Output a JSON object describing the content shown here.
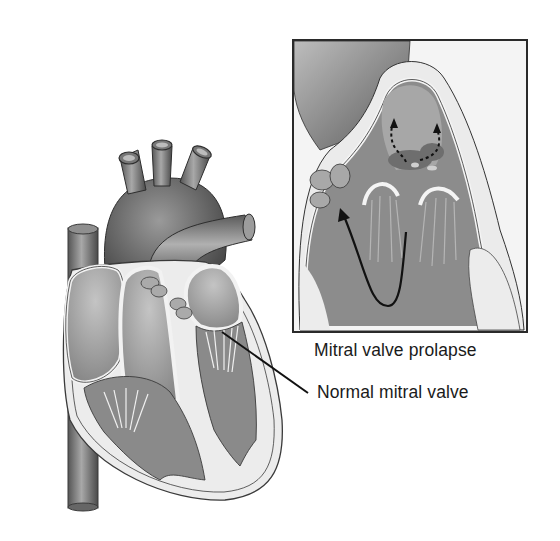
{
  "figure": {
    "style": "grayscale medical illustration",
    "colors": {
      "background": "#ffffff",
      "outline": "#2a2a2a",
      "vessel_dark": "#5a5a5a",
      "vessel_mid": "#8a8a8a",
      "chamber_fill": "#9a9a9a",
      "wall_light": "#e6e6e6",
      "tissue": "#7c7c7c",
      "label_text": "#1a1a1a"
    }
  },
  "labels": {
    "prolapse": "Mitral valve prolapse",
    "normal": "Normal mitral valve"
  },
  "inset": {
    "title_ref": "Mitral valve prolapse",
    "box": {
      "x": 293,
      "y": 40,
      "width": 234,
      "height": 292
    },
    "arrows": [
      "solid flow arrow (ventricle upward)",
      "dashed regurgitation arrows (2)"
    ]
  },
  "leader_line": {
    "from": {
      "x": 222,
      "y": 332
    },
    "to": {
      "x": 308,
      "y": 393
    },
    "points_to": "Normal mitral valve"
  }
}
